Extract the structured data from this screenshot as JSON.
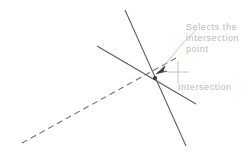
{
  "canvas": {
    "width": 251,
    "height": 160,
    "background": "#ffffff"
  },
  "colors": {
    "line_solid": "#5a5a60",
    "line_dashed": "#6b6b72",
    "leader": "#c9c9c9",
    "crosshair": "#c2c2c2",
    "text": "#b9b9b9"
  },
  "drawing": {
    "lines": [
      {
        "name": "line-steep",
        "style": "solid",
        "x1": 125,
        "y1": 10,
        "x2": 186,
        "y2": 146
      },
      {
        "name": "line-diagonal",
        "style": "solid",
        "x1": 97,
        "y1": 46,
        "x2": 196,
        "y2": 104
      },
      {
        "name": "line-dashed",
        "style": "dashed",
        "x1": 22,
        "y1": 143,
        "x2": 176,
        "y2": 58
      }
    ],
    "intersection_point": {
      "x": 155,
      "y": 78
    }
  },
  "annotations": {
    "crosshair": {
      "name": "crosshair-cursor",
      "cx": 178,
      "cy": 72,
      "arm": 11
    },
    "leader": {
      "name": "leader-line",
      "arrow_tip": {
        "x": 160,
        "y": 70
      },
      "bend": {
        "x": 183,
        "y": 43
      },
      "tail_end": {
        "x": 196,
        "y": 30
      }
    },
    "callout": {
      "label": "Selects the\nintersection\npoint",
      "lines": [
        "Selects the",
        "intersection",
        "point"
      ]
    },
    "snap_tooltip": {
      "label": "Intersection"
    }
  }
}
